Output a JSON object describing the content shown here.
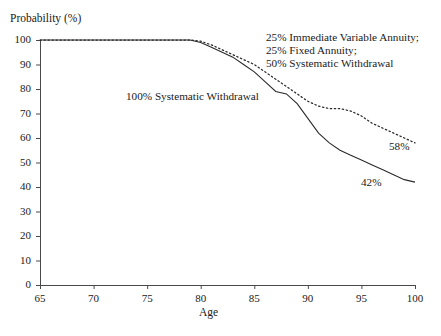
{
  "figure": {
    "top_remnant": ". . . . . . . ."
  },
  "chart_data": {
    "type": "line",
    "title": "",
    "xlabel": "Age",
    "ylabel": "Probability (%)",
    "xlim": [
      65,
      100
    ],
    "ylim": [
      0,
      100
    ],
    "xticks": [
      65,
      70,
      75,
      80,
      85,
      90,
      95,
      100
    ],
    "yticks": [
      0,
      10,
      20,
      30,
      40,
      50,
      60,
      70,
      80,
      90,
      100
    ],
    "grid": false,
    "legend_position": "inline-annotations",
    "annotations": [
      {
        "name": "annuity-mix-label",
        "lines": [
          "25% Immediate Variable Annuity;",
          "25% Fixed Annuity;",
          "50% Systematic Withdrawal"
        ],
        "series": "annuity-mix"
      },
      {
        "name": "systematic-withdrawal-label",
        "lines": [
          "100% Systematic Withdrawal"
        ],
        "series": "systematic-withdrawal"
      },
      {
        "name": "endpoint-label-annuity-mix",
        "lines": [
          "58%"
        ],
        "series": "annuity-mix",
        "value": 58
      },
      {
        "name": "endpoint-label-systematic-withdrawal",
        "lines": [
          "42%"
        ],
        "series": "systematic-withdrawal",
        "value": 42
      }
    ],
    "x": [
      65,
      66,
      67,
      68,
      69,
      70,
      71,
      72,
      73,
      74,
      75,
      76,
      77,
      78,
      79,
      80,
      81,
      82,
      83,
      84,
      85,
      86,
      87,
      88,
      89,
      90,
      91,
      92,
      93,
      94,
      95,
      96,
      97,
      98,
      99,
      100
    ],
    "series": [
      {
        "name": "25% Immediate Variable Annuity; 25% Fixed Annuity; 50% Systematic Withdrawal",
        "short_name": "annuity-mix",
        "style": "dotted",
        "color": "#2b2b2b",
        "end_value": 58,
        "values": [
          100,
          100,
          100,
          100,
          100,
          100,
          100,
          100,
          100,
          100,
          100,
          100,
          100,
          100,
          100,
          99.5,
          98,
          96,
          94,
          92,
          90,
          87,
          84,
          81,
          78,
          75,
          73,
          72,
          72,
          71,
          69,
          66,
          64,
          62,
          60,
          58
        ]
      },
      {
        "name": "100% Systematic Withdrawal",
        "short_name": "systematic-withdrawal",
        "style": "solid",
        "color": "#2b2b2b",
        "end_value": 42,
        "values": [
          100,
          100,
          100,
          100,
          100,
          100,
          100,
          100,
          100,
          100,
          100,
          100,
          100,
          100,
          100,
          99,
          97,
          95,
          93,
          90,
          87,
          83,
          79,
          78,
          74,
          68,
          62,
          58,
          55,
          53,
          51,
          49,
          47,
          45,
          43,
          42
        ]
      }
    ]
  }
}
